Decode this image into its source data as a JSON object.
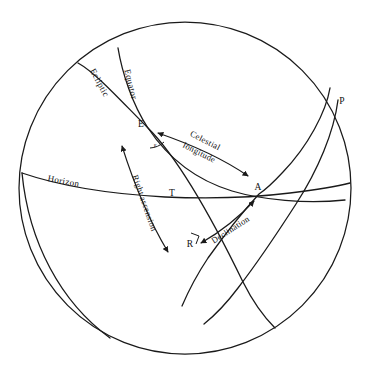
{
  "figure": {
    "kind": "celestial-sphere-diagram",
    "background_color": "#ffffff",
    "line_color": "#1a1a1a",
    "width": 369,
    "height": 368
  },
  "sphere": {
    "center_x": 185,
    "center_y": 188,
    "radius": 166
  },
  "points": [
    {
      "id": "E",
      "label": "E",
      "x": 148,
      "y": 128
    },
    {
      "id": "P",
      "label": "P",
      "x": 340,
      "y": 105
    },
    {
      "id": "A",
      "label": "A",
      "x": 259,
      "y": 194
    },
    {
      "id": "T",
      "label": "T",
      "x": 172,
      "y": 196
    },
    {
      "id": "R",
      "label": "R",
      "x": 193,
      "y": 243
    }
  ],
  "curves": [
    {
      "id": "ecliptic",
      "label": "Ecliptic"
    },
    {
      "id": "equator",
      "label": "Equator"
    },
    {
      "id": "horizon",
      "label": "Horizon"
    },
    {
      "id": "meridian",
      "label": ""
    }
  ],
  "measures": [
    {
      "id": "celestial-longitude",
      "line1": "Celestial",
      "line2": "longitude"
    },
    {
      "id": "right-ascension",
      "label": "Right ascension"
    },
    {
      "id": "declination",
      "label": "Declination"
    }
  ],
  "angles": [
    {
      "id": "obliquity",
      "label": "ε"
    }
  ]
}
